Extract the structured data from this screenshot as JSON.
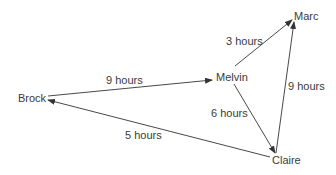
{
  "nodes": {
    "brock": "Brock",
    "melvin": "Melvin",
    "marc": "Marc",
    "claire": "Claire"
  },
  "edges": [
    {
      "from": "Brock",
      "to": "Melvin",
      "label": "9 hours"
    },
    {
      "from": "Melvin",
      "to": "Marc",
      "label": "3 hours"
    },
    {
      "from": "Melvin",
      "to": "Claire",
      "label": "6 hours"
    },
    {
      "from": "Claire",
      "to": "Marc",
      "label": "9 hours"
    },
    {
      "from": "Claire",
      "to": "Brock",
      "label": "5 hours"
    }
  ],
  "colors": {
    "line": "#333333",
    "text": "#3a3a3a",
    "background": "#ffffff"
  }
}
